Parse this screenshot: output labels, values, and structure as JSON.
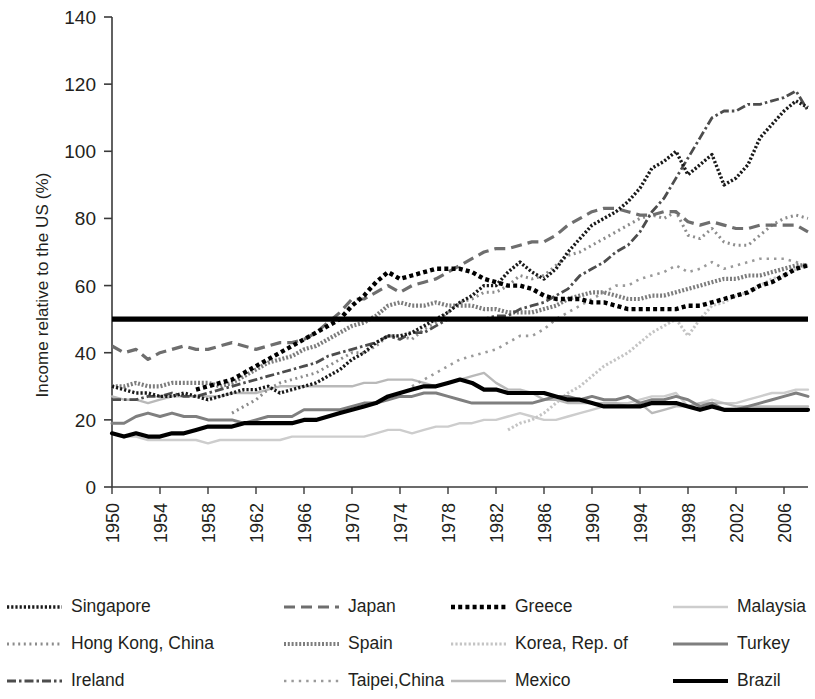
{
  "chart_data": {
    "type": "line",
    "title": "",
    "xlabel": "",
    "ylabel": "Income relative to the US (%)",
    "ylim": [
      0,
      140
    ],
    "yticks": [
      0,
      20,
      40,
      60,
      80,
      100,
      120,
      140
    ],
    "xlim": [
      1950,
      2008
    ],
    "xticks": [
      1950,
      1954,
      1958,
      1962,
      1966,
      1970,
      1974,
      1978,
      1982,
      1986,
      1990,
      1994,
      1998,
      2002,
      2006
    ],
    "grid": false,
    "legend_position": "bottom",
    "reference_line": {
      "value": 50,
      "style": "solid-thick",
      "color": "#000000"
    },
    "x": [
      1950,
      1951,
      1952,
      1953,
      1954,
      1955,
      1956,
      1957,
      1958,
      1959,
      1960,
      1961,
      1962,
      1963,
      1964,
      1965,
      1966,
      1967,
      1968,
      1969,
      1970,
      1971,
      1972,
      1973,
      1974,
      1975,
      1976,
      1977,
      1978,
      1979,
      1980,
      1981,
      1982,
      1983,
      1984,
      1985,
      1986,
      1987,
      1988,
      1989,
      1990,
      1991,
      1992,
      1993,
      1994,
      1995,
      1996,
      1997,
      1998,
      1999,
      2000,
      2001,
      2002,
      2003,
      2004,
      2005,
      2006,
      2007,
      2008
    ],
    "series": [
      {
        "name": "Singapore",
        "style": "dotted-dense",
        "color": "#1a1a1a",
        "values": [
          30,
          29,
          28,
          28,
          27,
          27,
          28,
          27,
          26,
          27,
          28,
          29,
          29,
          30,
          28,
          29,
          30,
          31,
          33,
          35,
          38,
          40,
          43,
          45,
          45,
          46,
          48,
          50,
          52,
          55,
          57,
          60,
          60,
          64,
          67,
          64,
          62,
          65,
          70,
          74,
          78,
          80,
          82,
          85,
          89,
          95,
          97,
          100,
          93,
          96,
          99,
          90,
          92,
          96,
          104,
          108,
          112,
          115,
          113
        ]
      },
      {
        "name": "Hong Kong, China",
        "style": "dotted-fine",
        "color": "#8c8c8c",
        "values": [
          null,
          null,
          null,
          null,
          null,
          null,
          null,
          null,
          null,
          null,
          22,
          24,
          26,
          29,
          31,
          32,
          33,
          34,
          36,
          38,
          40,
          40,
          42,
          45,
          45,
          44,
          47,
          49,
          52,
          55,
          56,
          58,
          58,
          60,
          63,
          62,
          63,
          66,
          69,
          70,
          72,
          74,
          76,
          78,
          80,
          81,
          80,
          82,
          75,
          74,
          77,
          73,
          72,
          72,
          75,
          78,
          80,
          81,
          80
        ]
      },
      {
        "name": "Ireland",
        "style": "dash-dot",
        "color": "#4d4d4d",
        "values": [
          26,
          26,
          26,
          27,
          27,
          28,
          27,
          27,
          28,
          29,
          30,
          31,
          32,
          33,
          34,
          35,
          36,
          37,
          39,
          40,
          41,
          42,
          43,
          45,
          44,
          46,
          46,
          48,
          50,
          50,
          50,
          50,
          51,
          51,
          53,
          54,
          55,
          57,
          59,
          63,
          65,
          67,
          70,
          72,
          76,
          82,
          86,
          92,
          98,
          104,
          110,
          112,
          112,
          114,
          114,
          115,
          116,
          118,
          112
        ]
      },
      {
        "name": "Japan",
        "style": "dashed-long",
        "color": "#6e6e6e",
        "values": [
          42,
          40,
          41,
          38,
          40,
          41,
          42,
          41,
          41,
          42,
          43,
          42,
          41,
          42,
          43,
          43,
          44,
          46,
          49,
          52,
          56,
          56,
          58,
          60,
          58,
          60,
          61,
          62,
          64,
          66,
          68,
          70,
          71,
          71,
          72,
          73,
          73,
          75,
          78,
          80,
          82,
          83,
          83,
          82,
          81,
          81,
          82,
          82,
          79,
          78,
          79,
          78,
          77,
          77,
          78,
          78,
          78,
          78,
          76
        ]
      },
      {
        "name": "Spain",
        "style": "dotted-dense-gray",
        "color": "#7d7d7d",
        "values": [
          30,
          30,
          31,
          30,
          30,
          31,
          31,
          31,
          31,
          30,
          31,
          33,
          35,
          37,
          38,
          39,
          41,
          42,
          44,
          46,
          48,
          49,
          51,
          54,
          55,
          54,
          54,
          55,
          54,
          54,
          54,
          53,
          53,
          52,
          52,
          52,
          53,
          54,
          56,
          57,
          58,
          58,
          57,
          56,
          56,
          57,
          57,
          58,
          59,
          60,
          61,
          62,
          62,
          63,
          63,
          64,
          65,
          66,
          66
        ]
      },
      {
        "name": "Taipei,China",
        "style": "dotted-sparse",
        "color": "#9a9a9a",
        "values": [
          null,
          null,
          null,
          null,
          null,
          null,
          null,
          null,
          null,
          null,
          null,
          null,
          null,
          null,
          null,
          null,
          null,
          null,
          null,
          null,
          null,
          null,
          null,
          null,
          null,
          30,
          32,
          34,
          36,
          38,
          39,
          40,
          41,
          43,
          45,
          45,
          47,
          50,
          52,
          54,
          56,
          58,
          60,
          60,
          62,
          63,
          64,
          66,
          64,
          65,
          67,
          65,
          66,
          67,
          68,
          68,
          68,
          67,
          66
        ]
      },
      {
        "name": "Greece",
        "style": "dotted-square",
        "color": "#000000",
        "values": [
          null,
          null,
          null,
          null,
          null,
          null,
          null,
          29,
          30,
          31,
          32,
          34,
          36,
          38,
          40,
          42,
          44,
          46,
          48,
          50,
          54,
          57,
          61,
          64,
          62,
          63,
          64,
          65,
          65,
          65,
          64,
          62,
          61,
          60,
          60,
          59,
          57,
          56,
          56,
          56,
          55,
          55,
          54,
          53,
          53,
          53,
          53,
          53,
          54,
          54,
          55,
          56,
          57,
          58,
          60,
          61,
          63,
          65,
          66
        ]
      },
      {
        "name": "Korea, Rep. of",
        "style": "dotted-light",
        "color": "#c4c4c4",
        "values": [
          null,
          null,
          null,
          null,
          null,
          null,
          null,
          null,
          null,
          null,
          null,
          null,
          null,
          null,
          null,
          null,
          null,
          null,
          null,
          null,
          null,
          null,
          null,
          null,
          null,
          null,
          null,
          null,
          null,
          null,
          null,
          null,
          null,
          17,
          19,
          20,
          22,
          25,
          28,
          30,
          33,
          36,
          38,
          40,
          43,
          46,
          48,
          50,
          45,
          50,
          54,
          55,
          57,
          58,
          60,
          62,
          63,
          65,
          66
        ]
      },
      {
        "name": "Mexico",
        "style": "solid-light",
        "color": "#b9b9b9",
        "values": [
          27,
          26,
          26,
          25,
          26,
          27,
          27,
          27,
          27,
          27,
          28,
          28,
          28,
          29,
          30,
          30,
          30,
          30,
          30,
          30,
          30,
          31,
          31,
          32,
          32,
          32,
          31,
          30,
          31,
          32,
          33,
          34,
          31,
          29,
          29,
          28,
          26,
          26,
          25,
          25,
          25,
          25,
          25,
          24,
          25,
          22,
          23,
          24,
          24,
          25,
          25,
          25,
          24,
          24,
          24,
          24,
          24,
          24,
          24
        ]
      },
      {
        "name": "Malaysia",
        "style": "solid-pale",
        "color": "#cdcdcd",
        "values": [
          16,
          15,
          15,
          14,
          14,
          14,
          14,
          14,
          13,
          14,
          14,
          14,
          14,
          14,
          14,
          15,
          15,
          15,
          15,
          15,
          15,
          15,
          16,
          17,
          17,
          16,
          17,
          18,
          18,
          19,
          19,
          20,
          20,
          21,
          22,
          21,
          20,
          20,
          21,
          22,
          23,
          24,
          25,
          25,
          26,
          27,
          27,
          28,
          24,
          25,
          26,
          25,
          25,
          26,
          27,
          28,
          28,
          29,
          29
        ]
      },
      {
        "name": "Turkey",
        "style": "solid-mid",
        "color": "#7f7f7f",
        "values": [
          19,
          19,
          21,
          22,
          21,
          22,
          21,
          21,
          20,
          20,
          20,
          19,
          20,
          21,
          21,
          21,
          23,
          23,
          23,
          23,
          24,
          25,
          25,
          26,
          27,
          27,
          28,
          28,
          27,
          26,
          25,
          25,
          25,
          25,
          25,
          25,
          26,
          27,
          27,
          26,
          27,
          26,
          26,
          27,
          25,
          26,
          26,
          27,
          26,
          24,
          25,
          23,
          23,
          24,
          25,
          26,
          27,
          28,
          27
        ]
      },
      {
        "name": "Brazil",
        "style": "solid-thick",
        "color": "#000000",
        "values": [
          16,
          15,
          16,
          15,
          15,
          16,
          16,
          17,
          18,
          18,
          18,
          19,
          19,
          19,
          19,
          19,
          20,
          20,
          21,
          22,
          23,
          24,
          25,
          27,
          28,
          29,
          30,
          30,
          31,
          32,
          31,
          29,
          29,
          28,
          28,
          28,
          28,
          27,
          26,
          26,
          25,
          24,
          24,
          24,
          24,
          25,
          25,
          25,
          24,
          23,
          24,
          23,
          23,
          23,
          23,
          23,
          23,
          23,
          23
        ]
      }
    ]
  },
  "axis": {
    "y_label": "Income relative to the US (%)",
    "y_ticks": [
      "0",
      "20",
      "40",
      "60",
      "80",
      "100",
      "120",
      "140"
    ],
    "x_ticks": [
      "1950",
      "1954",
      "1958",
      "1962",
      "1966",
      "1970",
      "1974",
      "1978",
      "1982",
      "1986",
      "1990",
      "1994",
      "1998",
      "2002",
      "2006"
    ]
  },
  "legend": {
    "rows": [
      [
        {
          "label": "Singapore",
          "swatch": "dotted-dense"
        },
        {
          "label": "Japan",
          "swatch": "dashed-long"
        },
        {
          "label": "Greece",
          "swatch": "dotted-square"
        },
        {
          "label": "Malaysia",
          "swatch": "solid-pale"
        }
      ],
      [
        {
          "label": "Hong Kong, China",
          "swatch": "dotted-fine"
        },
        {
          "label": "Spain",
          "swatch": "dotted-dense-gray"
        },
        {
          "label": "Korea, Rep. of",
          "swatch": "dotted-light"
        },
        {
          "label": "Turkey",
          "swatch": "solid-mid"
        }
      ],
      [
        {
          "label": "Ireland",
          "swatch": "dash-dot"
        },
        {
          "label": "Taipei,China",
          "swatch": "dotted-sparse"
        },
        {
          "label": "Mexico",
          "swatch": "solid-light"
        },
        {
          "label": "Brazil",
          "swatch": "solid-thick"
        }
      ]
    ]
  }
}
